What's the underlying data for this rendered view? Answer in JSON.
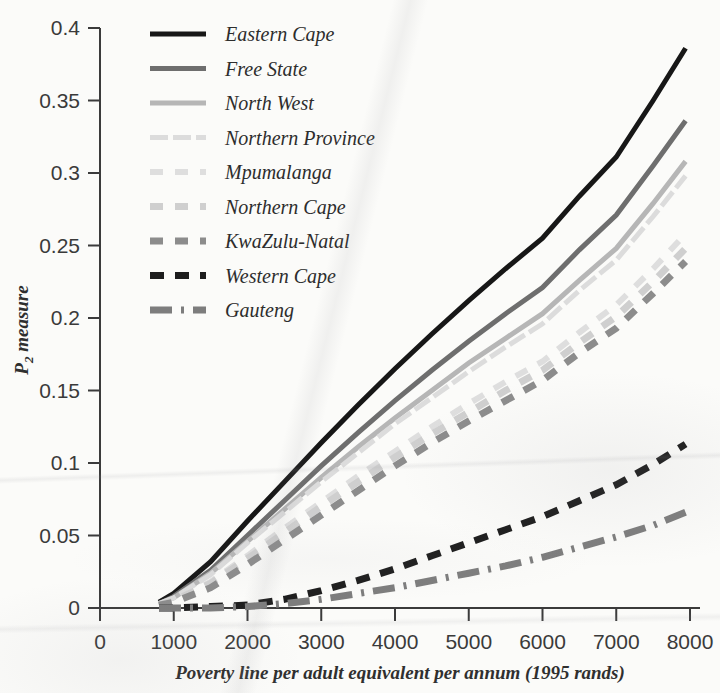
{
  "chart_data": {
    "type": "line",
    "title": "",
    "xlabel": "Poverty line per adult equivalent per annum (1995 rands)",
    "ylabel": "P2 measure",
    "ylabel_base": "P",
    "ylabel_sub": "2",
    "ylabel_rest": " measure",
    "xlim": [
      0,
      8000
    ],
    "ylim": [
      0,
      0.4
    ],
    "grid": false,
    "legend_position": "top-left inside",
    "xticks": [
      0,
      1000,
      2000,
      3000,
      4000,
      5000,
      6000,
      7000,
      8000
    ],
    "xtick_labels": [
      "0",
      "1000",
      "2000",
      "3000",
      "4000",
      "5000",
      "6000",
      "7000",
      "8000"
    ],
    "yticks": [
      0,
      0.05,
      0.1,
      0.15,
      0.2,
      0.25,
      0.3,
      0.35,
      0.4
    ],
    "ytick_labels": [
      "0",
      "0.05",
      "0.1",
      "0.15",
      "0.2",
      "0.25",
      "0.3",
      "0.35",
      "0.4"
    ],
    "x": [
      800,
      1000,
      1500,
      2000,
      2500,
      3000,
      3500,
      4000,
      4500,
      5000,
      5500,
      6000,
      6500,
      7000,
      7500,
      7940
    ],
    "series": [
      {
        "name": "Eastern Cape",
        "color": "#171717",
        "dash": "none",
        "width": 5,
        "values": [
          0.004,
          0.01,
          0.032,
          0.06,
          0.087,
          0.114,
          0.14,
          0.165,
          0.189,
          0.212,
          0.234,
          0.255,
          0.284,
          0.311,
          0.35,
          0.386
        ]
      },
      {
        "name": "Free State",
        "color": "#6e6e6e",
        "dash": "none",
        "width": 5,
        "values": [
          0.003,
          0.008,
          0.026,
          0.05,
          0.074,
          0.098,
          0.121,
          0.143,
          0.164,
          0.184,
          0.203,
          0.221,
          0.247,
          0.271,
          0.305,
          0.336
        ]
      },
      {
        "name": "North West",
        "color": "#b6b6b6",
        "dash": "none",
        "width": 5,
        "values": [
          0.003,
          0.007,
          0.024,
          0.046,
          0.068,
          0.09,
          0.111,
          0.131,
          0.15,
          0.169,
          0.186,
          0.203,
          0.226,
          0.248,
          0.279,
          0.308
        ]
      },
      {
        "name": "Northern Province",
        "color": "#dcdcdc",
        "dash": "18 5",
        "width": 5,
        "values": [
          0.003,
          0.007,
          0.023,
          0.045,
          0.066,
          0.087,
          0.107,
          0.127,
          0.145,
          0.163,
          0.18,
          0.196,
          0.219,
          0.24,
          0.27,
          0.298
        ]
      },
      {
        "name": "Mpumalanga",
        "color": "#dedede",
        "dash": "13 12",
        "width": 6,
        "values": [
          0.002,
          0.005,
          0.018,
          0.036,
          0.055,
          0.073,
          0.091,
          0.108,
          0.125,
          0.141,
          0.156,
          0.17,
          0.19,
          0.209,
          0.234,
          0.258
        ]
      },
      {
        "name": "Northern Cape",
        "color": "#cfcfcf",
        "dash": "13 12",
        "width": 7,
        "values": [
          0.002,
          0.005,
          0.017,
          0.034,
          0.052,
          0.07,
          0.087,
          0.104,
          0.12,
          0.135,
          0.15,
          0.164,
          0.183,
          0.201,
          0.225,
          0.248
        ]
      },
      {
        "name": "KwaZulu-Natal",
        "color": "#8c8c8c",
        "dash": "13 12",
        "width": 7,
        "values": [
          0.002,
          0.004,
          0.014,
          0.03,
          0.047,
          0.064,
          0.081,
          0.098,
          0.114,
          0.129,
          0.143,
          0.157,
          0.176,
          0.193,
          0.217,
          0.239
        ]
      },
      {
        "name": "Western Cape",
        "color": "#1d1d1d",
        "dash": "14 11",
        "width": 7,
        "values": [
          0.0,
          0.0,
          0.001,
          0.002,
          0.006,
          0.012,
          0.019,
          0.027,
          0.036,
          0.045,
          0.054,
          0.063,
          0.074,
          0.085,
          0.099,
          0.113
        ]
      },
      {
        "name": "Gauteng",
        "color": "#7d7d7d",
        "dash": "22 9 3 9",
        "width": 7,
        "values": [
          0.0,
          0.0,
          0.0,
          0.001,
          0.003,
          0.006,
          0.01,
          0.014,
          0.019,
          0.024,
          0.029,
          0.035,
          0.042,
          0.049,
          0.057,
          0.066
        ]
      }
    ]
  },
  "axes": {
    "x_title": "Poverty line per adult equivalent per annum (1995 rands)",
    "y_title_main": "P",
    "y_title_sub": "2",
    "y_title_tail": " measure"
  }
}
